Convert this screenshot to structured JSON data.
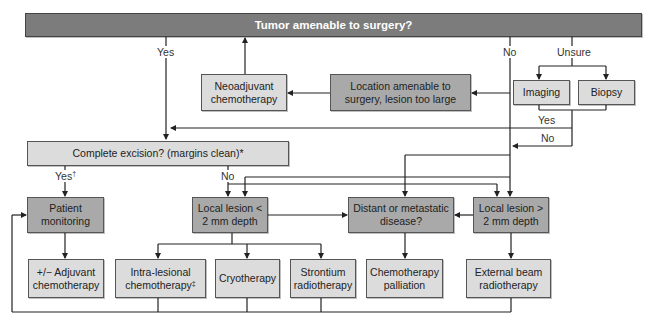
{
  "title": "Tumor amenable to surgery?",
  "nodes": {
    "neoadjuvant": "Neoadjuvant chemotherapy",
    "location": "Location amenable to surgery, lesion too large",
    "imaging": "Imaging",
    "biopsy": "Biopsy",
    "complete_excision": "Complete excision? (margins clean)*",
    "patient_monitoring": "Patient monitoring",
    "local_lt2": "Local lesion < 2 mm depth",
    "distant": "Distant or metastatic disease?",
    "local_gt2": "Local lesion > 2 mm depth",
    "adjuvant": "+/− Adjuvant chemotherapy",
    "intralesional": "Intra-lesional chemotherapy",
    "intralesional_mark": "‡",
    "cryotherapy": "Cryotherapy",
    "strontium": "Strontium radiotherapy",
    "chemo_palliation": "Chemotherapy palliation",
    "external_beam": "External beam radiotherapy"
  },
  "labels": {
    "yes_top": "Yes",
    "no_top": "No",
    "unsure": "Unsure",
    "yes_diag": "Yes",
    "no_diag": "No",
    "yes_excision": "Yes",
    "yes_excision_mark": "†",
    "no_excision": "No"
  },
  "colors": {
    "header_fill": "#7c7c7c",
    "decision_fill": "#a9a9a9",
    "action_fill": "#dcdcdc",
    "line": "#222222"
  }
}
